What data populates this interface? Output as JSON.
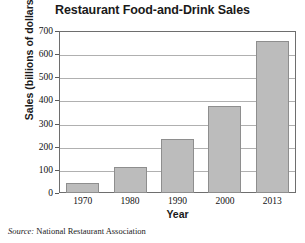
{
  "chart_data": {
    "type": "bar",
    "title": "Restaurant Food-and-Drink Sales",
    "xlabel": "Year",
    "ylabel": "Sales (billions of dollars)",
    "categories": [
      "1970",
      "1980",
      "1990",
      "2000",
      "2013"
    ],
    "values": [
      42,
      113,
      233,
      375,
      655
    ],
    "ylim": [
      0,
      700
    ],
    "ytick_values": [
      0,
      100,
      200,
      300,
      400,
      500,
      600,
      700
    ],
    "ytick_labels": [
      "0",
      "100",
      "200",
      "300",
      "400",
      "500",
      "600",
      "700"
    ],
    "grid": "horizontal",
    "legend": "none",
    "bar_color": "#bcbcbc",
    "bar_border_color": "#8e8e8e",
    "gridline_color": "#b0b0b0",
    "axis_color": "#6e6e6e"
  },
  "source": {
    "label": "Source:",
    "text": "National Restaurant Association"
  }
}
